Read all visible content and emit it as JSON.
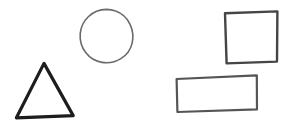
{
  "canvas": {
    "width": 290,
    "height": 131,
    "background_color": "#ffffff",
    "title": "hand-drawn-shapes-sketch"
  },
  "shapes": [
    {
      "name": "circle",
      "label": "circle",
      "stroke_color": "#6a6a6a",
      "stroke_width": 1.6,
      "bbox": {
        "x": 80,
        "y": 9,
        "width": 53,
        "height": 54
      },
      "center": {
        "x": 106,
        "y": 36
      },
      "radius": 27,
      "path": "M 106.5 9.4 C 92.0 9.6 81.2 20.6 80.2 34.0 C 79.2 47.8 88.6 60.2 102.0 62.4 C 115.6 64.6 128.9 56.4 132.0 43.6 C 135.2 30.4 128.8 15.6 115.6 11.0 C 112.7 9.9 109.6 9.4 106.5 9.4 Z"
    },
    {
      "name": "square",
      "label": "square",
      "stroke_color": "#454545",
      "stroke_width": 2.4,
      "bbox": {
        "x": 224,
        "y": 11,
        "width": 54,
        "height": 53
      },
      "path": "M 225.0 13.2 L 277.4 11.4 L 277.0 61.6 L 226.6 63.4 Z"
    },
    {
      "name": "triangle",
      "label": "triangle",
      "stroke_color": "#1d1d1d",
      "stroke_width": 3.2,
      "bbox": {
        "x": 16,
        "y": 63,
        "width": 58,
        "height": 55
      },
      "vertices": [
        {
          "x": 44,
          "y": 63
        },
        {
          "x": 73,
          "y": 116
        },
        {
          "x": 16,
          "y": 118
        }
      ],
      "path": "M 44.0 63.4 L 73.2 115.6 L 16.4 117.8 Z"
    },
    {
      "name": "rectangle",
      "label": "rectangle",
      "stroke_color": "#555555",
      "stroke_width": 2.2,
      "bbox": {
        "x": 176,
        "y": 75,
        "width": 81,
        "height": 37
      },
      "path": "M 176.6 79.0 L 256.8 75.4 L 257.0 109.4 L 177.4 112.0 Z"
    }
  ]
}
